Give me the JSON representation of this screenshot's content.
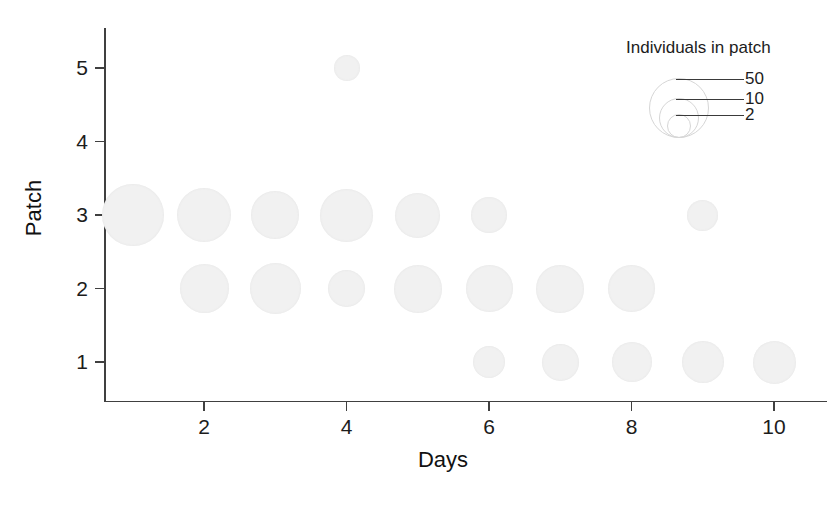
{
  "chart_data": {
    "type": "scatter",
    "title": "",
    "xlabel": "Days",
    "ylabel": "Patch",
    "xlim": [
      0.5,
      10.6
    ],
    "ylim": [
      0.5,
      5.5
    ],
    "grid": false,
    "x_ticks": [
      "2",
      "4",
      "6",
      "8",
      "10"
    ],
    "x_tick_values": [
      2,
      4,
      6,
      8,
      10
    ],
    "y_ticks": [
      "1",
      "2",
      "3",
      "4",
      "5"
    ],
    "y_tick_values": [
      1,
      2,
      3,
      4,
      5
    ],
    "size_encoding": "bubble area ~ individuals in patch",
    "points": [
      {
        "day": 1,
        "patch": 3,
        "individuals": 58,
        "radius_px": 31
      },
      {
        "day": 2,
        "patch": 3,
        "individuals": 42,
        "radius_px": 27
      },
      {
        "day": 3,
        "patch": 3,
        "individuals": 33,
        "radius_px": 24
      },
      {
        "day": 4,
        "patch": 3,
        "individuals": 40,
        "radius_px": 26.5
      },
      {
        "day": 5,
        "patch": 3,
        "individuals": 29,
        "radius_px": 22.5
      },
      {
        "day": 6,
        "patch": 3,
        "individuals": 18,
        "radius_px": 18
      },
      {
        "day": 9,
        "patch": 3,
        "individuals": 13,
        "radius_px": 15.5
      },
      {
        "day": 2,
        "patch": 2,
        "individuals": 35,
        "radius_px": 24.5
      },
      {
        "day": 3,
        "patch": 2,
        "individuals": 37,
        "radius_px": 25.5
      },
      {
        "day": 4,
        "patch": 2,
        "individuals": 19,
        "radius_px": 18.5
      },
      {
        "day": 5,
        "patch": 2,
        "individuals": 33,
        "radius_px": 24
      },
      {
        "day": 6,
        "patch": 2,
        "individuals": 31,
        "radius_px": 23.5
      },
      {
        "day": 7,
        "patch": 2,
        "individuals": 32,
        "radius_px": 24
      },
      {
        "day": 8,
        "patch": 2,
        "individuals": 31,
        "radius_px": 23.5
      },
      {
        "day": 6,
        "patch": 1,
        "individuals": 14,
        "radius_px": 16
      },
      {
        "day": 7,
        "patch": 1,
        "individuals": 19,
        "radius_px": 18.5
      },
      {
        "day": 8,
        "patch": 1,
        "individuals": 22,
        "radius_px": 20
      },
      {
        "day": 9,
        "patch": 1,
        "individuals": 24,
        "radius_px": 21
      },
      {
        "day": 10,
        "patch": 1,
        "individuals": 25,
        "radius_px": 21.5
      },
      {
        "day": 4,
        "patch": 5,
        "individuals": 10,
        "radius_px": 13
      }
    ],
    "legend": {
      "position": "top-right",
      "title": "Individuals in patch",
      "entries": [
        {
          "label": "50",
          "value": 50,
          "radius_px": 29
        },
        {
          "label": "10",
          "value": 10,
          "radius_px": 19
        },
        {
          "label": "2",
          "value": 2,
          "radius_px": 11
        }
      ]
    },
    "colors": {
      "bubble_fill": "#f1f1f1",
      "axis": "#404040",
      "text": "#1c1c1c",
      "legend_outline": "#d6d6d6",
      "background": "#ffffff"
    }
  }
}
